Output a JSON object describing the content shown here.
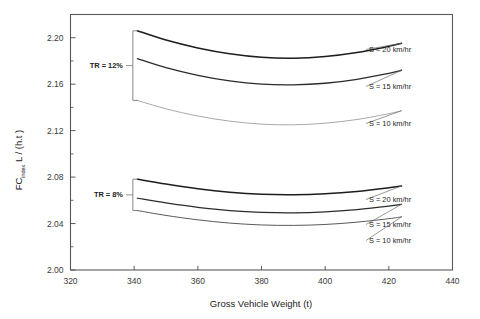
{
  "chart_data": {
    "type": "line",
    "title": "",
    "xlabel": "Gross Vehicle Weight (t)",
    "ylabel_main": "FC",
    "ylabel_sub": "index",
    "ylabel_unit": "L / (h.t )",
    "xlim": [
      320,
      440
    ],
    "ylim": [
      2.0,
      2.22
    ],
    "xticks": [
      320,
      340,
      360,
      380,
      400,
      420,
      440
    ],
    "yticks": [
      2.0,
      2.04,
      2.08,
      2.12,
      2.16,
      2.2
    ],
    "ytick_labels": [
      "2.00",
      "2.04",
      "2.08",
      "2.12",
      "2.16",
      "2.20"
    ],
    "xtick_labels": [
      "320",
      "340",
      "360",
      "380",
      "400",
      "420",
      "440"
    ],
    "grid": false,
    "legend_position": "inline-right-labels",
    "groups": [
      {
        "name": "TR = 12%",
        "bracket_label": "TR = 12%",
        "series": [
          {
            "name": "S = 20 km/hr",
            "label": "S = 20 km/hr",
            "color": "#1d1d1d",
            "width": 1.5,
            "x": [
              341,
              350,
              360,
              370,
              380,
              390,
              400,
              410,
              420,
              424
            ],
            "y": [
              2.206,
              2.198,
              2.1912,
              2.1862,
              2.1832,
              2.1824,
              2.1838,
              2.1872,
              2.1926,
              2.1952
            ]
          },
          {
            "name": "S = 15 km/hr",
            "label": "S = 15 km/hr",
            "color": "#2b2b2b",
            "width": 1.3,
            "x": [
              341,
              350,
              360,
              370,
              380,
              390,
              400,
              410,
              420,
              424
            ],
            "y": [
              2.182,
              2.1742,
              2.1676,
              2.1628,
              2.16,
              2.1594,
              2.1608,
              2.1642,
              2.1694,
              2.172
            ]
          },
          {
            "name": "S = 10 km/hr",
            "label": "S = 10 km/hr",
            "color": "#a8a8a8",
            "width": 1.0,
            "x": [
              341,
              350,
              360,
              370,
              380,
              390,
              400,
              410,
              420,
              424
            ],
            "y": [
              2.146,
              2.1388,
              2.1326,
              2.1282,
              2.1256,
              2.125,
              2.1264,
              2.1296,
              2.1346,
              2.1372
            ]
          }
        ]
      },
      {
        "name": "TR = 8%",
        "bracket_label": "TR = 8%",
        "series": [
          {
            "name": "S = 20 km/hr",
            "label": "S = 20 km/hr",
            "color": "#1d1d1d",
            "width": 1.5,
            "x": [
              341,
              350,
              360,
              370,
              380,
              390,
              400,
              410,
              420,
              424
            ],
            "y": [
              2.0782,
              2.074,
              2.07,
              2.067,
              2.0652,
              2.0648,
              2.0656,
              2.0676,
              2.0708,
              2.0724
            ]
          },
          {
            "name": "S = 15 km/hr",
            "label": "S = 15 km/hr",
            "color": "#2b2b2b",
            "width": 1.2,
            "x": [
              341,
              350,
              360,
              370,
              380,
              390,
              400,
              410,
              420,
              424
            ],
            "y": [
              2.0618,
              2.0578,
              2.054,
              2.0512,
              2.0496,
              2.0492,
              2.05,
              2.052,
              2.055,
              2.0566
            ]
          },
          {
            "name": "S = 10 km/hr",
            "label": "S = 10 km/hr",
            "color": "#5a5a5a",
            "width": 1.0,
            "x": [
              341,
              350,
              360,
              370,
              380,
              390,
              400,
              410,
              420,
              424
            ],
            "y": [
              2.0512,
              2.047,
              2.0432,
              2.0404,
              2.0388,
              2.0384,
              2.0392,
              2.0412,
              2.0442,
              2.0458
            ]
          }
        ]
      }
    ]
  }
}
